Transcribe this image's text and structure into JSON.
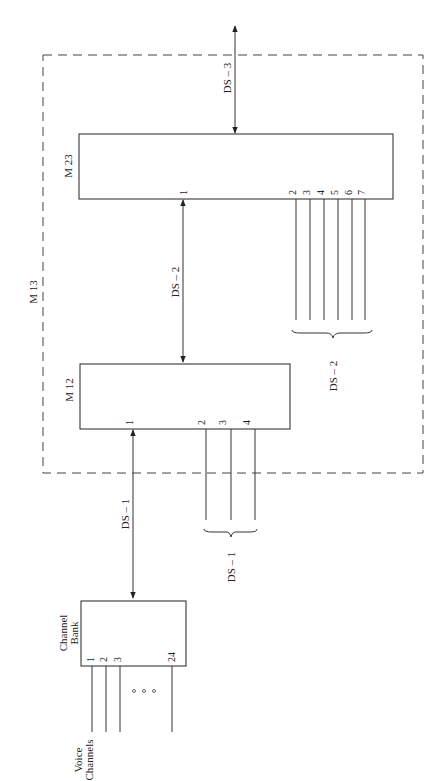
{
  "diagram": {
    "type": "block-diagram",
    "orientation": "rotated-90-ccw",
    "outer_container": {
      "label": "M 13",
      "style": "dashed"
    },
    "blocks": [
      {
        "id": "channel_bank",
        "label_line1": "Channel",
        "label_line2": "Bank",
        "inputs": [
          "1",
          "2",
          "3",
          "24"
        ],
        "ellipsis": "o o o"
      },
      {
        "id": "m12",
        "label": "M 12",
        "ports": [
          "1",
          "2",
          "3",
          "4"
        ]
      },
      {
        "id": "m23",
        "label": "M 23",
        "ports": [
          "1",
          "2",
          "3",
          "4",
          "5",
          "6",
          "7"
        ]
      }
    ],
    "links": [
      {
        "from": "channel_bank",
        "to": "m12",
        "label": "DS – 1",
        "bidirectional": true
      },
      {
        "from": "m12",
        "to": "m23",
        "label": "DS – 2",
        "bidirectional": true
      },
      {
        "from": "m23",
        "to": "external",
        "label": "DS – 3",
        "bidirectional": true
      }
    ],
    "groups": [
      {
        "attached_to": "m12",
        "label": "DS – 1"
      },
      {
        "attached_to": "m23",
        "label": "DS – 2"
      }
    ],
    "input_label_line1": "Voice",
    "input_label_line2": "Channels"
  }
}
